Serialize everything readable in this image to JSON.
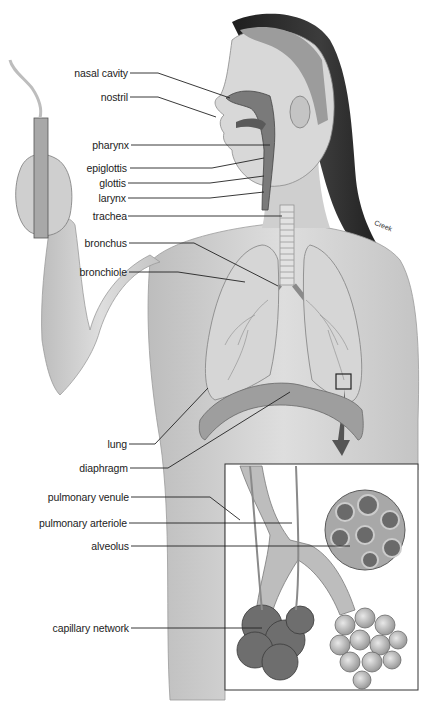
{
  "diagram": {
    "credit": "Creek",
    "labels": [
      {
        "id": "nasal-cavity",
        "text": "nasal cavity",
        "x": 128,
        "y": 73
      },
      {
        "id": "nostril",
        "text": "nostril",
        "x": 128,
        "y": 97
      },
      {
        "id": "pharynx",
        "text": "pharynx",
        "x": 129,
        "y": 145
      },
      {
        "id": "epiglottis",
        "text": "epiglottis",
        "x": 127,
        "y": 168
      },
      {
        "id": "glottis",
        "text": "glottis",
        "x": 126,
        "y": 183
      },
      {
        "id": "larynx",
        "text": "larynx",
        "x": 126,
        "y": 198
      },
      {
        "id": "trachea",
        "text": "trachea",
        "x": 127,
        "y": 216
      },
      {
        "id": "bronchus",
        "text": "bronchus",
        "x": 127,
        "y": 243
      },
      {
        "id": "bronchiole",
        "text": "bronchiole",
        "x": 127,
        "y": 272
      },
      {
        "id": "lung",
        "text": "lung",
        "x": 127,
        "y": 444
      },
      {
        "id": "diaphragm",
        "text": "diaphragm",
        "x": 128,
        "y": 468
      },
      {
        "id": "pulmonary-venule",
        "text": "pulmonary venule",
        "x": 129,
        "y": 497
      },
      {
        "id": "pulmonary-arteriole",
        "text": "pulmonary arteriole",
        "x": 127,
        "y": 523
      },
      {
        "id": "alveolus",
        "text": "alveolus",
        "x": 129,
        "y": 546
      },
      {
        "id": "capillary-network",
        "text": "capillary network",
        "x": 129,
        "y": 628
      }
    ],
    "colors": {
      "background": "#ffffff",
      "line": "#222222",
      "skin": "#d4d4d4",
      "hair": "#2a2a2a",
      "lung": "#c8c8c8",
      "tissue": "#8a8a8a"
    }
  }
}
